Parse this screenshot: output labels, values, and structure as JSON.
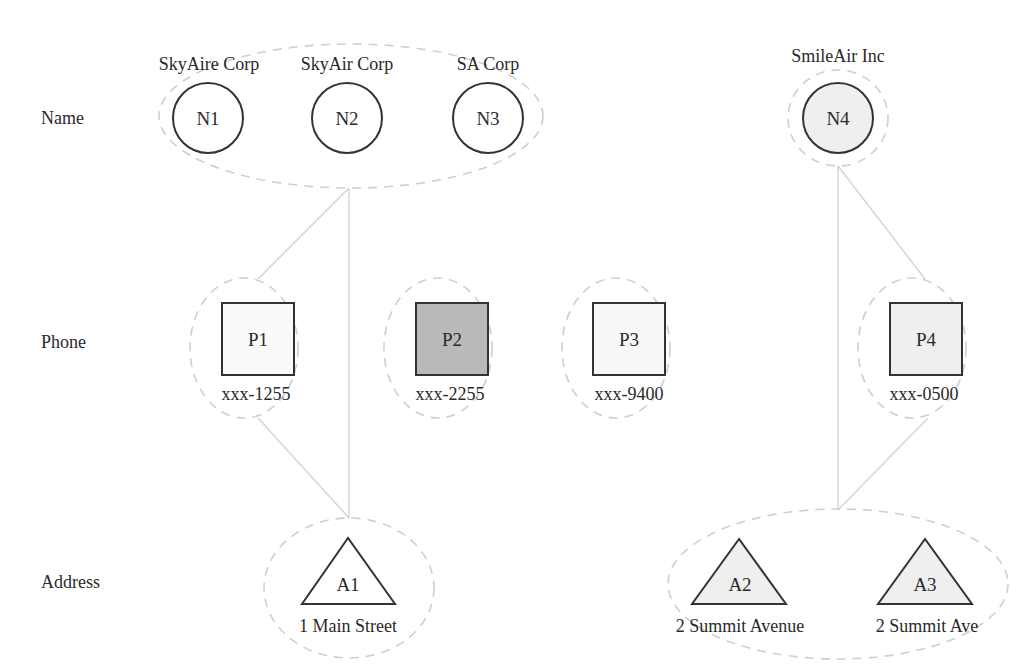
{
  "rows": {
    "name": "Name",
    "phone": "Phone",
    "address": "Address"
  },
  "nodes": {
    "N1": {
      "id": "N1",
      "label": "SkyAire Corp",
      "shape": "circle",
      "fill": "#ffffff"
    },
    "N2": {
      "id": "N2",
      "label": "SkyAir Corp",
      "shape": "circle",
      "fill": "#ffffff"
    },
    "N3": {
      "id": "N3",
      "label": "SA Corp",
      "shape": "circle",
      "fill": "#ffffff"
    },
    "N4": {
      "id": "N4",
      "label": "SmileAir Inc",
      "shape": "circle",
      "fill": "#efefef"
    },
    "P1": {
      "id": "P1",
      "label": "xxx-1255",
      "shape": "square",
      "fill": "#fafafa"
    },
    "P2": {
      "id": "P2",
      "label": "xxx-2255",
      "shape": "square",
      "fill": "#b9b9b9"
    },
    "P3": {
      "id": "P3",
      "label": "xxx-9400",
      "shape": "square",
      "fill": "#f7f7f7"
    },
    "P4": {
      "id": "P4",
      "label": "xxx-0500",
      "shape": "square",
      "fill": "#efefef"
    },
    "A1": {
      "id": "A1",
      "label": "1 Main Street",
      "shape": "triangle",
      "fill": "#ffffff"
    },
    "A2": {
      "id": "A2",
      "label": "2 Summit Avenue",
      "shape": "triangle",
      "fill": "#efefef"
    },
    "A3": {
      "id": "A3",
      "label": "2 Summit Ave",
      "shape": "triangle",
      "fill": "#efefef"
    }
  },
  "groups": [
    {
      "name": "name-group-1",
      "members": [
        "N1",
        "N2",
        "N3"
      ]
    },
    {
      "name": "name-group-2",
      "members": [
        "N4"
      ]
    },
    {
      "name": "phone-group-1",
      "members": [
        "P1"
      ]
    },
    {
      "name": "phone-group-2",
      "members": [
        "P2"
      ]
    },
    {
      "name": "phone-group-3",
      "members": [
        "P3"
      ]
    },
    {
      "name": "phone-group-4",
      "members": [
        "P4"
      ]
    },
    {
      "name": "address-group-1",
      "members": [
        "A1"
      ]
    },
    {
      "name": "address-group-2",
      "members": [
        "A2",
        "A3"
      ]
    }
  ],
  "edges": [
    [
      "name-group-1",
      "phone-group-1"
    ],
    [
      "name-group-1",
      "address-group-1"
    ],
    [
      "phone-group-1",
      "address-group-1"
    ],
    [
      "name-group-2",
      "phone-group-4"
    ],
    [
      "name-group-2",
      "address-group-2"
    ],
    [
      "phone-group-4",
      "address-group-2"
    ]
  ],
  "colors": {
    "stroke": "#333333",
    "group_outline": "#cfcfcf",
    "edge": "#d6d6d6",
    "highlight_fill": "#b9b9b9",
    "light_fill": "#efefef"
  }
}
